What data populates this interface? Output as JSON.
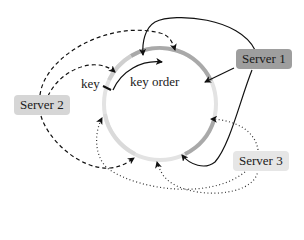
{
  "diagram": {
    "type": "consistent-hashing-ring",
    "ring": {
      "center": [
        160,
        104
      ],
      "radius": 56,
      "base_color": "#e3e3e3",
      "segment_colors": {
        "server1": "#a9a9a9",
        "server2": "#cfcfcf",
        "server3": "#d8d8d8"
      }
    },
    "labels": {
      "key": "key",
      "key_order": "key order"
    },
    "servers": [
      {
        "id": "server1",
        "label": "Server 1",
        "fill": "#9e9e9e",
        "line_style": "solid"
      },
      {
        "id": "server2",
        "label": "Server 2",
        "fill": "#d6d6d6",
        "line_style": "dashed"
      },
      {
        "id": "server3",
        "label": "Server 3",
        "fill": "#e6e6e6",
        "line_style": "dotted"
      }
    ],
    "edges": [
      {
        "from": "Server 1",
        "to": "ring-top",
        "style": "solid"
      },
      {
        "from": "Server 1",
        "to": "ring-right-upper",
        "style": "solid"
      },
      {
        "from": "Server 1",
        "to": "ring-bottom-right",
        "style": "solid"
      },
      {
        "from": "Server 2",
        "to": "ring-top-right",
        "style": "dashed"
      },
      {
        "from": "Server 2",
        "to": "ring-upper-left",
        "style": "dashed"
      },
      {
        "from": "Server 2",
        "to": "ring-bottom",
        "style": "dashed"
      },
      {
        "from": "Server 3",
        "to": "ring-right-lower",
        "style": "dotted"
      },
      {
        "from": "Server 3",
        "to": "ring-left-lower",
        "style": "dotted"
      },
      {
        "from": "Server 3",
        "to": "ring-bottom",
        "style": "dotted"
      }
    ]
  }
}
